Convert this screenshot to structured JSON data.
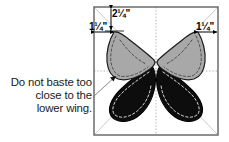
{
  "figure": {
    "kind": "sewing-placement-diagram",
    "background_color": "#ffffff"
  },
  "block": {
    "frame_color": "#6b6b6b",
    "guide_line_color": "#b9b9b9",
    "center_line_color": "#9a9a9a"
  },
  "dimensions": [
    {
      "id": "top",
      "label": "2¼\"",
      "orientation": "vertical",
      "meaning": "distance from top edge of block to top of upper wing"
    },
    {
      "id": "left",
      "label": "1¼\"",
      "orientation": "horizontal",
      "meaning": "distance from left edge of block to left wing tip"
    },
    {
      "id": "right",
      "label": "1¼\"",
      "orientation": "horizontal",
      "meaning": "distance from right edge of block to right wing tip"
    }
  ],
  "callout": {
    "lines": [
      "Do not baste too",
      "close to the",
      "lower wing."
    ],
    "leader": "points to junction of upper and lower left wing"
  },
  "wings": {
    "upper_fill": "#a8a8a8",
    "upper_stroke": "#1a1a1a",
    "lower_fill": "#0d0d0d",
    "lower_stroke": "#000000",
    "upper_stitch_color": "#3a3a3a",
    "lower_stitch_color": "#ffffff"
  }
}
